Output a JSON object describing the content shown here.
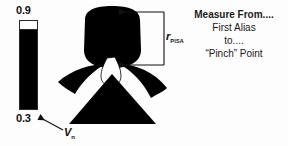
{
  "figure": {
    "background_color": "#fdfdfd",
    "ink_color": "#111111"
  },
  "scale": {
    "max_label": "0.9",
    "min_label": "0.3",
    "bar_top_color": "#ffffff",
    "bar_body_color": "#000000"
  },
  "velocity": {
    "symbol": "V",
    "subscript": "n"
  },
  "measurement": {
    "radius_symbol": "r",
    "radius_subscript": "PISA",
    "bracket_icon": "measurement-bracket-icon"
  },
  "anatomy": {
    "icon": "pisa-flow-convergence-icon",
    "chamber_color": "#000000",
    "neck_color": "#ffffff",
    "cone_color": "#000000"
  },
  "caption": {
    "title": "Measure From....",
    "lines": [
      "First Alias",
      "to....",
      "“Pinch” Point"
    ]
  }
}
